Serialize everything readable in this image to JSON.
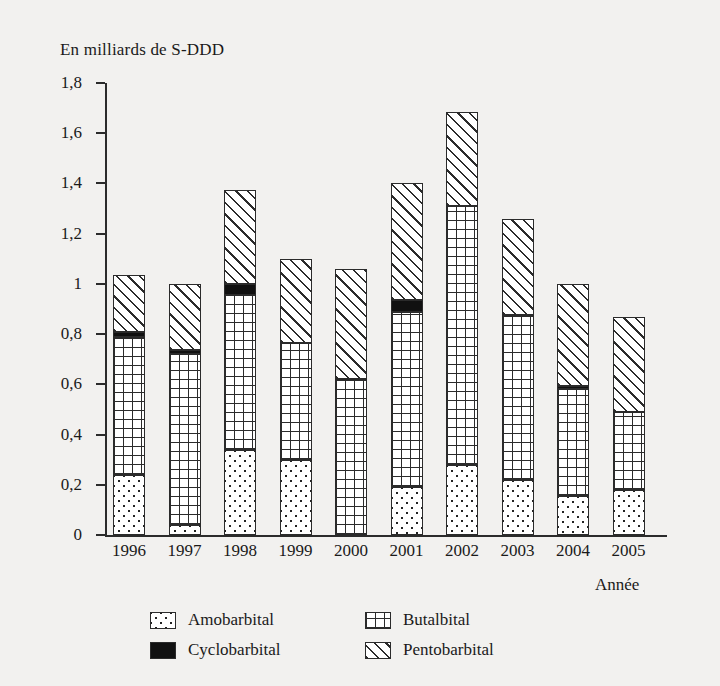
{
  "axis_title": "En milliards de S-DDD",
  "x_axis_label": "Année",
  "legend": [
    {
      "key": "amo",
      "label": "Amobarbital",
      "pattern": "dots"
    },
    {
      "key": "but",
      "label": "Butalbital",
      "pattern": "grid"
    },
    {
      "key": "cyc",
      "label": "Cyclobarbital",
      "pattern": "solid-black"
    },
    {
      "key": "pen",
      "label": "Pentobarbital",
      "pattern": "diagonal-hatch"
    }
  ],
  "y_ticks": [
    "0",
    "0,2",
    "0,4",
    "0,6",
    "0,8",
    "1",
    "1,2",
    "1,4",
    "1,6",
    "1,8"
  ],
  "chart_data": {
    "type": "bar",
    "stacked": true,
    "title": "En milliards de S-DDD",
    "xlabel": "Année",
    "ylabel": "En milliards de S-DDD",
    "ylim": [
      0,
      1.8
    ],
    "ytick_step": 0.2,
    "grid": false,
    "legend_position": "bottom",
    "categories": [
      "1996",
      "1997",
      "1998",
      "1999",
      "2000",
      "2001",
      "2002",
      "2003",
      "2004",
      "2005"
    ],
    "series": [
      {
        "name": "Amobarbital",
        "values": [
          0.24,
          0.04,
          0.34,
          0.3,
          0.0,
          0.19,
          0.28,
          0.22,
          0.155,
          0.18
        ]
      },
      {
        "name": "Butalbital",
        "values": [
          0.55,
          0.68,
          0.615,
          0.465,
          0.62,
          0.7,
          1.03,
          0.655,
          0.425,
          0.31
        ]
      },
      {
        "name": "Cyclobarbital",
        "values": [
          0.02,
          0.015,
          0.045,
          0.0,
          0.0,
          0.045,
          0.0,
          0.0,
          0.015,
          0.0
        ]
      },
      {
        "name": "Pentobarbital",
        "values": [
          0.225,
          0.265,
          0.375,
          0.335,
          0.44,
          0.465,
          0.375,
          0.385,
          0.405,
          0.38
        ]
      }
    ],
    "totals": [
      1.035,
      1.0,
      1.375,
      1.1,
      1.06,
      1.4,
      1.685,
      1.26,
      1.0,
      0.87
    ]
  }
}
